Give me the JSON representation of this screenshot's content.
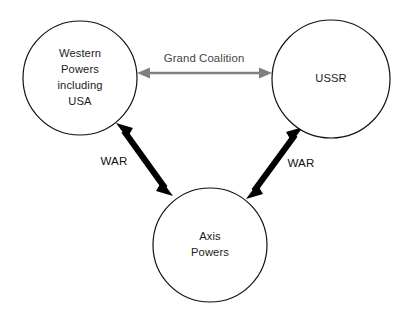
{
  "diagram": {
    "background_color": "#ffffff",
    "nodes": [
      {
        "id": "western-powers",
        "lines": [
          "Western",
          "Powers",
          "including",
          "USA"
        ],
        "cx": 80,
        "cy": 78,
        "r": 57,
        "stroke": "#111111",
        "fill": "#ffffff"
      },
      {
        "id": "ussr",
        "lines": [
          "USSR"
        ],
        "cx": 331,
        "cy": 79,
        "r": 59,
        "stroke": "#111111",
        "fill": "#ffffff"
      },
      {
        "id": "axis-powers",
        "lines": [
          "Axis",
          "Powers"
        ],
        "cx": 210,
        "cy": 245,
        "r": 57,
        "stroke": "#111111",
        "fill": "#ffffff"
      }
    ],
    "edges": [
      {
        "id": "grand-coalition",
        "label": "Grand Coalition",
        "from": "western-powers",
        "to": "ussr",
        "style": "double-arrow-thin",
        "color": "#808080",
        "label_x": 204,
        "label_y": 62
      },
      {
        "id": "war-west-axis",
        "label": "WAR",
        "from": "western-powers",
        "to": "axis-powers",
        "style": "double-arrow-thick",
        "color": "#000000",
        "label_x": 114,
        "label_y": 165
      },
      {
        "id": "war-ussr-axis",
        "label": "WAR",
        "from": "ussr",
        "to": "axis-powers",
        "style": "double-arrow-thick",
        "color": "#000000",
        "label_x": 301,
        "label_y": 167
      }
    ]
  }
}
